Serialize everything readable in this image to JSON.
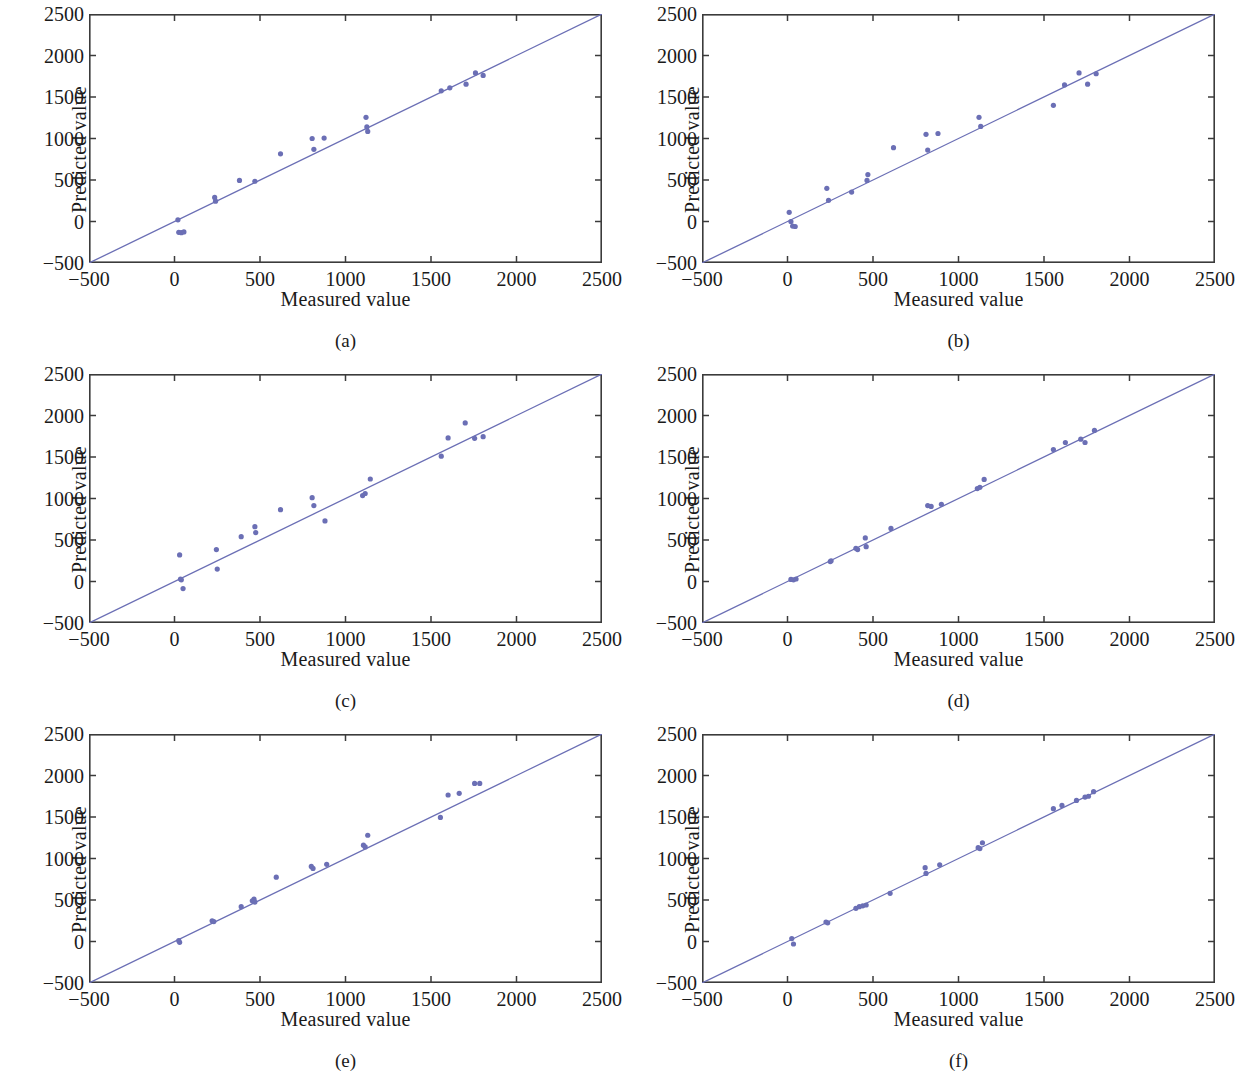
{
  "figure": {
    "type": "scatter-grid",
    "rows": 3,
    "cols": 2,
    "n_panels": 6
  },
  "axis": {
    "xlabel": "Measured value",
    "ylabel": "Predicted value",
    "xticks": [
      "−500",
      "0",
      "500",
      "1000",
      "1500",
      "2000",
      "2500"
    ],
    "yticks": [
      "2500",
      "2000",
      "1500",
      "1000",
      "500",
      "0",
      "−500"
    ],
    "xtick_values": [
      -500,
      0,
      500,
      1000,
      1500,
      2000,
      2500
    ],
    "ytick_values": [
      2500,
      2000,
      1500,
      1000,
      500,
      0,
      -500
    ]
  },
  "colors": {
    "marker": "#6b6fb5",
    "line": "#6b6fb5",
    "axis": "#3b3b3b",
    "background": "#ffffff",
    "text": "#1a1a1a"
  },
  "captions": {
    "a": "(a)",
    "b": "(b)",
    "c": "(c)",
    "d": "(d)",
    "e": "(e)",
    "f": "(f)"
  },
  "chart_data": [
    {
      "type": "scatter",
      "panel": "a",
      "title": "(a)",
      "xlabel": "Measured value",
      "ylabel": "Predicted value",
      "xlim": [
        -500,
        2500
      ],
      "ylim": [
        -500,
        2500
      ],
      "grid": false,
      "legend": null,
      "reference_line": {
        "type": "identity",
        "from": [
          -500,
          -500
        ],
        "to": [
          2500,
          2500
        ]
      },
      "points": [
        [
          20,
          20
        ],
        [
          25,
          -130
        ],
        [
          40,
          -135
        ],
        [
          55,
          -125
        ],
        [
          235,
          290
        ],
        [
          240,
          245
        ],
        [
          380,
          495
        ],
        [
          470,
          485
        ],
        [
          620,
          815
        ],
        [
          805,
          1000
        ],
        [
          815,
          870
        ],
        [
          875,
          1005
        ],
        [
          1120,
          1255
        ],
        [
          1125,
          1140
        ],
        [
          1130,
          1085
        ],
        [
          1560,
          1575
        ],
        [
          1610,
          1610
        ],
        [
          1705,
          1655
        ],
        [
          1760,
          1790
        ],
        [
          1805,
          1760
        ]
      ]
    },
    {
      "type": "scatter",
      "panel": "b",
      "title": "(b)",
      "xlabel": "Measured value",
      "ylabel": "Predicted value",
      "xlim": [
        -500,
        2500
      ],
      "ylim": [
        -500,
        2500
      ],
      "grid": false,
      "legend": null,
      "reference_line": {
        "type": "identity",
        "from": [
          -500,
          -500
        ],
        "to": [
          2500,
          2500
        ]
      },
      "points": [
        [
          10,
          110
        ],
        [
          20,
          0
        ],
        [
          30,
          -55
        ],
        [
          45,
          -60
        ],
        [
          230,
          400
        ],
        [
          240,
          255
        ],
        [
          375,
          355
        ],
        [
          465,
          495
        ],
        [
          470,
          565
        ],
        [
          620,
          890
        ],
        [
          810,
          1050
        ],
        [
          820,
          860
        ],
        [
          880,
          1060
        ],
        [
          1120,
          1255
        ],
        [
          1130,
          1145
        ],
        [
          1555,
          1400
        ],
        [
          1620,
          1645
        ],
        [
          1705,
          1790
        ],
        [
          1755,
          1655
        ],
        [
          1805,
          1780
        ]
      ]
    },
    {
      "type": "scatter",
      "panel": "c",
      "title": "(c)",
      "xlabel": "Measured value",
      "ylabel": "Predicted value",
      "xlim": [
        -500,
        2500
      ],
      "ylim": [
        -500,
        2500
      ],
      "grid": false,
      "legend": null,
      "reference_line": {
        "type": "identity",
        "from": [
          -500,
          -500
        ],
        "to": [
          2500,
          2500
        ]
      },
      "points": [
        [
          30,
          320
        ],
        [
          35,
          30
        ],
        [
          40,
          20
        ],
        [
          50,
          -85
        ],
        [
          245,
          385
        ],
        [
          250,
          150
        ],
        [
          390,
          540
        ],
        [
          470,
          660
        ],
        [
          475,
          590
        ],
        [
          620,
          865
        ],
        [
          805,
          1010
        ],
        [
          815,
          915
        ],
        [
          880,
          730
        ],
        [
          1100,
          1035
        ],
        [
          1115,
          1060
        ],
        [
          1145,
          1235
        ],
        [
          1560,
          1510
        ],
        [
          1600,
          1730
        ],
        [
          1700,
          1910
        ],
        [
          1755,
          1725
        ],
        [
          1805,
          1745
        ]
      ]
    },
    {
      "type": "scatter",
      "panel": "d",
      "title": "(d)",
      "xlabel": "Measured value",
      "ylabel": "Predicted value",
      "xlim": [
        -500,
        2500
      ],
      "ylim": [
        -500,
        2500
      ],
      "grid": false,
      "legend": null,
      "reference_line": {
        "type": "identity",
        "from": [
          -500,
          -500
        ],
        "to": [
          2500,
          2500
        ]
      },
      "points": [
        [
          20,
          25
        ],
        [
          35,
          20
        ],
        [
          50,
          30
        ],
        [
          250,
          240
        ],
        [
          255,
          250
        ],
        [
          400,
          400
        ],
        [
          410,
          385
        ],
        [
          455,
          525
        ],
        [
          460,
          420
        ],
        [
          605,
          640
        ],
        [
          820,
          915
        ],
        [
          840,
          905
        ],
        [
          900,
          930
        ],
        [
          1110,
          1120
        ],
        [
          1125,
          1135
        ],
        [
          1150,
          1230
        ],
        [
          1555,
          1590
        ],
        [
          1625,
          1675
        ],
        [
          1715,
          1715
        ],
        [
          1740,
          1675
        ],
        [
          1795,
          1820
        ]
      ]
    },
    {
      "type": "scatter",
      "panel": "e",
      "title": "(e)",
      "xlabel": "Measured value",
      "ylabel": "Predicted value",
      "xlim": [
        -500,
        2500
      ],
      "ylim": [
        -500,
        2500
      ],
      "grid": false,
      "legend": null,
      "reference_line": {
        "type": "identity",
        "from": [
          -500,
          -500
        ],
        "to": [
          2500,
          2500
        ]
      },
      "points": [
        [
          25,
          10
        ],
        [
          30,
          -10
        ],
        [
          220,
          250
        ],
        [
          230,
          240
        ],
        [
          390,
          420
        ],
        [
          455,
          490
        ],
        [
          465,
          510
        ],
        [
          470,
          475
        ],
        [
          595,
          775
        ],
        [
          800,
          905
        ],
        [
          810,
          880
        ],
        [
          890,
          930
        ],
        [
          1105,
          1160
        ],
        [
          1115,
          1140
        ],
        [
          1130,
          1280
        ],
        [
          1555,
          1495
        ],
        [
          1600,
          1765
        ],
        [
          1665,
          1785
        ],
        [
          1755,
          1905
        ],
        [
          1785,
          1905
        ]
      ]
    },
    {
      "type": "scatter",
      "panel": "f",
      "title": "(f)",
      "xlabel": "Measured value",
      "ylabel": "Predicted value",
      "xlim": [
        -500,
        2500
      ],
      "ylim": [
        -500,
        2500
      ],
      "grid": false,
      "legend": null,
      "reference_line": {
        "type": "identity",
        "from": [
          -500,
          -500
        ],
        "to": [
          2500,
          2500
        ]
      },
      "points": [
        [
          25,
          35
        ],
        [
          35,
          -30
        ],
        [
          225,
          235
        ],
        [
          235,
          225
        ],
        [
          400,
          400
        ],
        [
          420,
          420
        ],
        [
          440,
          430
        ],
        [
          460,
          440
        ],
        [
          600,
          580
        ],
        [
          805,
          890
        ],
        [
          810,
          820
        ],
        [
          890,
          925
        ],
        [
          1115,
          1130
        ],
        [
          1125,
          1120
        ],
        [
          1140,
          1190
        ],
        [
          1555,
          1600
        ],
        [
          1605,
          1640
        ],
        [
          1690,
          1700
        ],
        [
          1740,
          1740
        ],
        [
          1760,
          1750
        ],
        [
          1790,
          1805
        ]
      ]
    }
  ]
}
